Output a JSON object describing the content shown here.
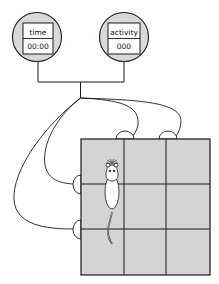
{
  "displays": [
    {
      "id": "time",
      "label": "time",
      "value": "00:00"
    },
    {
      "id": "activity",
      "label": "activity",
      "value": "000"
    }
  ],
  "arena": {
    "rows": 3,
    "cols": 3,
    "sensors": {
      "top": 2,
      "left": 2
    }
  },
  "colors": {
    "display_fill": "#d9d9d9",
    "arena_fill": "#d4d4d4",
    "line": "#1a1a1a",
    "background": "#ffffff"
  }
}
